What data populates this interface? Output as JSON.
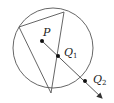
{
  "diagram": {
    "type": "geometry",
    "stroke_color": "#555555",
    "point_color": "#111111",
    "circle": {
      "cx": 53,
      "cy": 48,
      "r": 40
    },
    "triangle": {
      "vertices": [
        [
          64,
          12
        ],
        [
          19,
          27
        ],
        [
          51,
          93
        ]
      ]
    },
    "points": [
      {
        "name": "P",
        "label": "P",
        "subscript": "",
        "x": 42,
        "y": 41,
        "label_x": 43,
        "label_y": 36
      },
      {
        "name": "Q1",
        "label": "Q",
        "subscript": "1",
        "x": 58,
        "y": 56,
        "label_x": 64,
        "label_y": 56
      },
      {
        "name": "Q2",
        "label": "Q",
        "subscript": "2",
        "x": 85,
        "y": 81,
        "label_x": 93,
        "label_y": 83
      }
    ],
    "ray": {
      "from": [
        42,
        41
      ],
      "to": [
        102,
        98
      ]
    }
  }
}
